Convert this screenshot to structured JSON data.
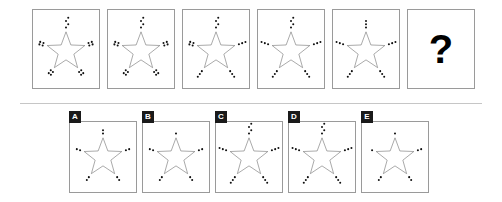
{
  "puzzle": {
    "type": "visual-analogy-matrix",
    "question_mark": "?",
    "star_points": 5,
    "dot_color": "#111111",
    "star_stroke_color": "#6f6f6f",
    "panel_border_color": "#9a9a9a",
    "divider_color": "#c6c6c6"
  },
  "sequence": {
    "panels": [
      {
        "name": "panel-1",
        "dots_per_arm": 4,
        "arrangement": "cluster-2x2",
        "arms": [
          {
            "arm": "top",
            "count": 4
          },
          {
            "arm": "upper-left",
            "count": 4
          },
          {
            "arm": "upper-right",
            "count": 4
          },
          {
            "arm": "lower-left",
            "count": 4
          },
          {
            "arm": "lower-right",
            "count": 4
          }
        ]
      },
      {
        "name": "panel-2",
        "dots_per_arm": 4,
        "arrangement": "cluster-2x2",
        "arms": [
          {
            "arm": "top",
            "count": 4
          },
          {
            "arm": "upper-left",
            "count": 4
          },
          {
            "arm": "upper-right",
            "count": 4
          },
          {
            "arm": "lower-left",
            "count": 4
          },
          {
            "arm": "lower-right",
            "count": 4
          }
        ]
      },
      {
        "name": "panel-3",
        "dots_per_arm": 4,
        "arrangement": "cluster-L",
        "arms": [
          {
            "arm": "top",
            "count": 4
          },
          {
            "arm": "upper-left",
            "count": 4
          },
          {
            "arm": "upper-right",
            "count": 3
          },
          {
            "arm": "lower-left",
            "count": 3
          },
          {
            "arm": "lower-right",
            "count": 3
          }
        ]
      },
      {
        "name": "panel-4",
        "dots_per_arm": 3,
        "arrangement": "line-diagonal",
        "arms": [
          {
            "arm": "top",
            "count": 4
          },
          {
            "arm": "upper-left",
            "count": 3
          },
          {
            "arm": "upper-right",
            "count": 3
          },
          {
            "arm": "lower-left",
            "count": 3
          },
          {
            "arm": "lower-right",
            "count": 3
          }
        ]
      },
      {
        "name": "panel-5",
        "dots_per_arm": 3,
        "arrangement": "line-diagonal",
        "arms": [
          {
            "arm": "top",
            "count": 3
          },
          {
            "arm": "upper-left",
            "count": 3
          },
          {
            "arm": "upper-right",
            "count": 3
          },
          {
            "arm": "lower-left",
            "count": 3
          },
          {
            "arm": "lower-right",
            "count": 3
          }
        ]
      },
      {
        "name": "panel-6-question",
        "dots_per_arm": null,
        "arrangement": "question-mark",
        "arms": []
      }
    ]
  },
  "options": [
    {
      "label": "A",
      "name": "option-a",
      "dots_per_arm": 2,
      "arms": [
        {
          "arm": "top",
          "count": 2
        },
        {
          "arm": "upper-left",
          "count": 2
        },
        {
          "arm": "upper-right",
          "count": 2
        },
        {
          "arm": "lower-left",
          "count": 2
        },
        {
          "arm": "lower-right",
          "count": 2
        }
      ]
    },
    {
      "label": "B",
      "name": "option-b",
      "dots_per_arm": 1,
      "arms": [
        {
          "arm": "top",
          "count": 1
        },
        {
          "arm": "upper-left",
          "count": 2
        },
        {
          "arm": "upper-right",
          "count": 2
        },
        {
          "arm": "lower-left",
          "count": 2
        },
        {
          "arm": "lower-right",
          "count": 2
        }
      ]
    },
    {
      "label": "C",
      "name": "option-c",
      "dots_per_arm": 3,
      "arms": [
        {
          "arm": "top",
          "count": 4
        },
        {
          "arm": "upper-left",
          "count": 3
        },
        {
          "arm": "upper-right",
          "count": 3
        },
        {
          "arm": "lower-left",
          "count": 3
        },
        {
          "arm": "lower-right",
          "count": 3
        }
      ]
    },
    {
      "label": "D",
      "name": "option-d",
      "dots_per_arm": 3,
      "arms": [
        {
          "arm": "top",
          "count": 4
        },
        {
          "arm": "upper-left",
          "count": 3
        },
        {
          "arm": "upper-right",
          "count": 3
        },
        {
          "arm": "lower-left",
          "count": 3
        },
        {
          "arm": "lower-right",
          "count": 3
        }
      ]
    },
    {
      "label": "E",
      "name": "option-e",
      "dots_per_arm": 1,
      "arms": [
        {
          "arm": "top",
          "count": 1
        },
        {
          "arm": "upper-left",
          "count": 1
        },
        {
          "arm": "upper-right",
          "count": 2
        },
        {
          "arm": "lower-left",
          "count": 2
        },
        {
          "arm": "lower-right",
          "count": 2
        }
      ]
    }
  ]
}
